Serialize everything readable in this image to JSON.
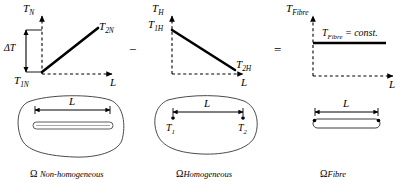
{
  "figure": {
    "type": "scientific-diagram"
  },
  "operators": {
    "minus": "−",
    "equals": "="
  },
  "panels": [
    {
      "id": "non-homogeneous",
      "y_axis_label": "T",
      "y_axis_sub": "N",
      "x_axis_label": "L",
      "start_label": "T",
      "start_sub": "1N",
      "end_label": "T",
      "end_sub": "2N",
      "delta_label": "ΔT",
      "profile": "increasing",
      "caption_symbol": "Ω",
      "caption_name": "Non-homogeneous"
    },
    {
      "id": "homogeneous",
      "y_axis_label": "T",
      "y_axis_sub": "H",
      "x_axis_label": "L",
      "start_label": "T",
      "start_sub": "1H",
      "end_label": "T",
      "end_sub": "2H",
      "profile": "decreasing",
      "caption_symbol": "Ω",
      "caption_name": "Homogeneous",
      "point1_label": "T",
      "point1_sub": "1",
      "point2_label": "T",
      "point2_sub": "2"
    },
    {
      "id": "fibre",
      "y_axis_label": "T",
      "y_axis_sub": "Fibre",
      "x_axis_label": "L",
      "const_expr_label": "T",
      "const_expr_sub": "Fibre",
      "const_expr_tail": "= const.",
      "profile": "constant",
      "caption_symbol": "Ω",
      "caption_name": "Fibre"
    }
  ],
  "length_label": "L",
  "colors": {
    "line": "#000000",
    "axis": "#000000",
    "outline": "#3a3a3a",
    "background": "#ffffff"
  }
}
